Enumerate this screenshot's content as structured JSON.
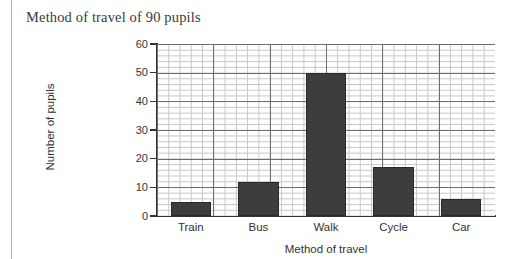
{
  "page": {
    "margin_rule": "vertical-rule"
  },
  "chart_data": {
    "type": "bar",
    "title": "Method of travel of 90 pupils",
    "xlabel": "Method of travel",
    "ylabel": "Number of pupils",
    "categories": [
      "Train",
      "Bus",
      "Walk",
      "Cycle",
      "Car"
    ],
    "values": [
      5,
      12,
      50,
      17,
      6
    ],
    "ylim": [
      0,
      60
    ],
    "ytick_labels": [
      "0",
      "10",
      "20",
      "30",
      "40",
      "50",
      "60"
    ],
    "ytick_values": [
      0,
      10,
      20,
      30,
      40,
      50,
      60
    ],
    "grid": "graph-paper: minor gridlines every 1 unit (vertical) with major gridlines every 10 units",
    "legend": "none",
    "bar_color": "#3d3d3d",
    "grid_major_color": "#6e6e6e",
    "grid_minor_color": "#bcbcbc",
    "axis_color": "#333333",
    "background": "#ffffff"
  }
}
